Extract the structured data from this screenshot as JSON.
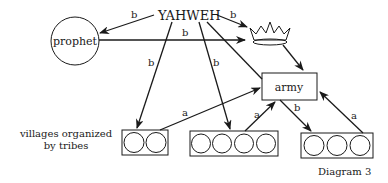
{
  "diagram": {
    "caption": "Diagram 3",
    "nodes": {
      "yahweh": "YAHWEH",
      "prophet": "prophet",
      "army": "army",
      "king": "crown-icon",
      "villages_label_line1": "villages organized",
      "villages_label_line2": "by tribes"
    },
    "edge_labels": {
      "yahweh_to_prophet": "b",
      "yahweh_to_king": "b",
      "prophet_to_king": "b",
      "yahweh_to_village2": "b",
      "village1_to_army": "a",
      "village2_to_army": "a",
      "army_to_village3": "b",
      "village3_to_army": "a"
    },
    "village_groups": [
      {
        "circles": 2
      },
      {
        "circles": 4
      },
      {
        "circles": 3
      }
    ]
  }
}
